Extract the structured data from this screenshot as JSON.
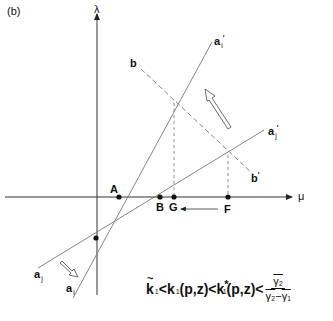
{
  "panel_label": "(b)",
  "axes": {
    "y_label": "λ",
    "x_label": "μ"
  },
  "lines": {
    "a_i_start": "a",
    "a_i_start_sub": "i",
    "a_i_end": "a",
    "a_i_end_sub": "i",
    "a_i_end_prime": "′",
    "a_j_start": "a",
    "a_j_start_sub": "j",
    "a_j_end": "a",
    "a_j_end_sub": "j",
    "a_j_end_prime": "′",
    "b_start": "b",
    "b_end": "b",
    "b_end_prime": "′"
  },
  "points": {
    "A": "A",
    "B": "B",
    "G": "G",
    "F": "F"
  },
  "formula": {
    "k_tilde": "k",
    "k_tilde_sub": "1",
    "lt1": "<",
    "k": "k",
    "k_sub": "1",
    "args1": "(p,z)",
    "lt2": "<",
    "k_star": "k",
    "k_star_sub": "1",
    "k_star_sup": "*",
    "args2": "(p,z)",
    "lt3": "<",
    "num": "γ₂",
    "den_a": "γ₂",
    "den_minus": "−",
    "den_b": "γ₁"
  }
}
